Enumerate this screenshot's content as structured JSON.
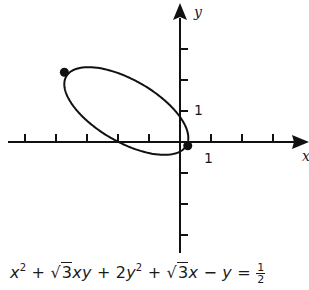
{
  "chart_data": {
    "type": "scatter",
    "title": "",
    "xlabel": "x",
    "ylabel": "y",
    "equation": {
      "text": "x^2 + √3xy + 2y^2 + √3x − y = 1/2",
      "coefficients": {
        "A": 1,
        "B": 1.7320508,
        "C": 2,
        "D": 1.7320508,
        "E": -1,
        "F": -0.5
      }
    },
    "curve": "ellipse",
    "xlim": [
      -5.2,
      4.2
    ],
    "ylim": [
      -3.6,
      4.5
    ],
    "x_ticks": [
      -5,
      -4,
      -3,
      -2,
      -1,
      1,
      2,
      3
    ],
    "y_ticks": [
      -3,
      -2,
      -1,
      1,
      2,
      3
    ],
    "tick_labels": {
      "x": "1",
      "y": "1"
    },
    "marked_points": [
      {
        "x": 0.25,
        "y": -0.12
      },
      {
        "x": -3.73,
        "y": 2.25
      }
    ],
    "grid": false,
    "legend": null
  },
  "labels": {
    "x_axis": "x",
    "y_axis": "y",
    "x_tick_one": "1",
    "y_tick_one": "1"
  },
  "equation_parts": {
    "x": "x",
    "two": "2",
    "plus": "+",
    "sqrt_sign": "√",
    "three": "3",
    "xy": "xy",
    "two_coef": "2",
    "y": "y",
    "minus": "−",
    "equals": "=",
    "num": "1",
    "den": "2"
  },
  "layout": {
    "origin_px": [
      180,
      142
    ],
    "unit_px": 31,
    "stroke": "#111111"
  }
}
